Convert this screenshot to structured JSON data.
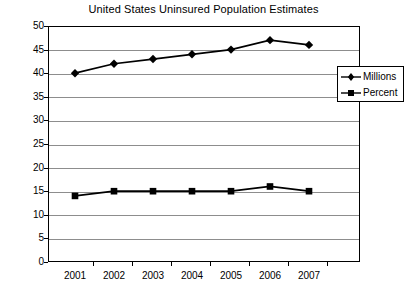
{
  "chart_data": {
    "type": "line",
    "title": "United States Uninsured Population Estimates",
    "xlabel": "",
    "ylabel": "",
    "categories": [
      "2001",
      "2002",
      "2003",
      "2004",
      "2005",
      "2006",
      "2007"
    ],
    "series": [
      {
        "name": "Millions",
        "marker": "diamond",
        "color": "#000000",
        "values": [
          40,
          42,
          43,
          44,
          45,
          47,
          46
        ]
      },
      {
        "name": "Percent",
        "marker": "square",
        "color": "#000000",
        "values": [
          14,
          15,
          15,
          15,
          15,
          16,
          15
        ]
      }
    ],
    "ylim": [
      0,
      50
    ],
    "ytick_step": 5,
    "yticks": [
      0,
      5,
      10,
      15,
      20,
      25,
      30,
      35,
      40,
      45,
      50
    ],
    "grid": "horizontal",
    "legend_position": "right",
    "legend_entries": [
      "Millions",
      "Percent"
    ]
  },
  "legend": {
    "millions_label": "Millions",
    "percent_label": "Percent"
  }
}
